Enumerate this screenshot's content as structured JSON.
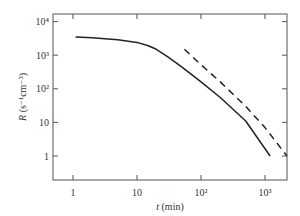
{
  "chart_data": {
    "type": "line",
    "title": "",
    "xlabel": "t (min)",
    "ylabel": "R (s⁻¹cm⁻³)",
    "xscale": "log",
    "yscale": "log",
    "xlim": [
      0.75,
      2200
    ],
    "ylim": [
      0.35,
      12500
    ],
    "x_ticks": [
      1,
      10,
      100,
      1000
    ],
    "x_tick_labels": [
      "1",
      "10",
      "10²",
      "10³"
    ],
    "y_ticks": [
      1,
      10,
      100,
      1000,
      10000
    ],
    "y_tick_labels": [
      "1",
      "10",
      "10²",
      "10³",
      "10⁴"
    ],
    "grid": false,
    "legend": null,
    "series": [
      {
        "name": "solid",
        "style": "solid",
        "x": [
          1.1,
          2,
          5,
          10,
          15,
          20,
          30,
          50,
          100,
          200,
          500,
          1200
        ],
        "values": [
          3500,
          3300,
          2900,
          2400,
          1900,
          1500,
          900,
          450,
          160,
          55,
          11,
          1
        ]
      },
      {
        "name": "dashed",
        "style": "dashed",
        "x": [
          55,
          100,
          200,
          500,
          1000,
          2200
        ],
        "values": [
          1500,
          520,
          160,
          30,
          7,
          1
        ]
      }
    ]
  },
  "labels": {
    "xlabel_italic": "t",
    "xlabel_rest": " (min)",
    "ylabel_italic": "R",
    "ylabel_rest": " (s⁻¹cm⁻³)"
  }
}
